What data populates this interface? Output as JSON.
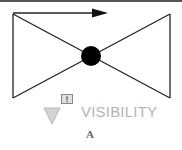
{
  "diagram": {
    "symbol": "valve-bowtie",
    "flow_arrow": "right-arrow",
    "visibility_label": "VISIBILITY",
    "indicator_icon": "exclamation-box-icon",
    "indicator_text": "!",
    "marker_icon": "down-triangle-icon",
    "figure_letter": "A",
    "colors": {
      "lines": "#222222",
      "hub": "#000000",
      "label": "#b4b4b4",
      "triangle_fill": "#d4d4d4",
      "triangle_stroke": "#aaaaaa",
      "box_fill": "#e0e0e0",
      "box_stroke": "#888888"
    }
  }
}
